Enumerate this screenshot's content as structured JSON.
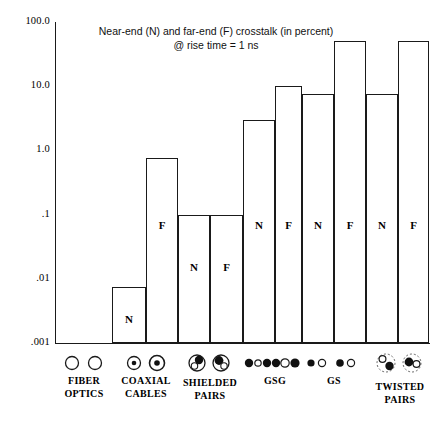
{
  "chart_data": {
    "type": "bar",
    "title": "Near-end (N) and far-end (F) crosstalk (in percent)\n@ rise time = 1 ns",
    "title_line1": "Near-end (N) and far-end (F) crosstalk (in percent)",
    "title_line2": "@ rise time = 1 ns",
    "xlabel": "",
    "ylabel": "",
    "yscale": "log",
    "ylim": [
      0.001,
      100.0
    ],
    "grid": false,
    "legend": "none",
    "ytick_labels": [
      "100.0",
      "10.0",
      "1.0",
      ".1",
      ".01",
      ".001"
    ],
    "ytick_values": [
      100.0,
      10.0,
      1.0,
      0.1,
      0.01,
      0.001
    ],
    "categories": [
      "FIBER OPTICS",
      "COAXIAL CABLES",
      "SHIELDED PAIRS",
      "GSG",
      "GS",
      "TWISTED PAIRS"
    ],
    "series": [
      {
        "name": "N",
        "label": "Near-end (N)",
        "values": [
          null,
          0.0075,
          0.1,
          3.0,
          7.5,
          7.5
        ]
      },
      {
        "name": "F",
        "label": "Far-end (F)",
        "values": [
          null,
          0.75,
          0.1,
          10.0,
          50.0,
          50.0
        ]
      }
    ],
    "bars": [
      {
        "category": "FIBER OPTICS",
        "series": "N",
        "value": null,
        "letter": "",
        "visible": false,
        "x": 55,
        "width": 28
      },
      {
        "category": "FIBER OPTICS",
        "series": "F",
        "value": null,
        "letter": "",
        "visible": false,
        "x": 84,
        "width": 28
      },
      {
        "category": "COAXIAL CABLES",
        "series": "N",
        "value": 0.0075,
        "letter": "N",
        "visible": true,
        "x": 112,
        "width": 34
      },
      {
        "category": "COAXIAL CABLES",
        "series": "F",
        "value": 0.75,
        "letter": "F",
        "visible": true,
        "x": 146,
        "width": 32
      },
      {
        "category": "SHIELDED PAIRS",
        "series": "N",
        "value": 0.1,
        "letter": "N",
        "visible": true,
        "x": 178,
        "width": 32
      },
      {
        "category": "SHIELDED PAIRS",
        "series": "F",
        "value": 0.1,
        "letter": "F",
        "visible": true,
        "x": 210,
        "width": 33
      },
      {
        "category": "GSG",
        "series": "N",
        "value": 3.0,
        "letter": "N",
        "visible": true,
        "x": 243,
        "width": 32
      },
      {
        "category": "GSG",
        "series": "F",
        "value": 10.0,
        "letter": "F",
        "visible": true,
        "x": 275,
        "width": 27
      },
      {
        "category": "GS",
        "series": "N",
        "value": 7.5,
        "letter": "N",
        "visible": true,
        "x": 302,
        "width": 32
      },
      {
        "category": "GS",
        "series": "F",
        "value": 50.0,
        "letter": "F",
        "visible": true,
        "x": 334,
        "width": 32
      },
      {
        "category": "TWISTED PAIRS",
        "series": "N",
        "value": 7.5,
        "letter": "N",
        "visible": true,
        "x": 366,
        "width": 32
      },
      {
        "category": "TWISTED PAIRS",
        "series": "F",
        "value": 50.0,
        "letter": "F",
        "visible": true,
        "x": 398,
        "width": 31
      }
    ]
  },
  "axis": {
    "y_labels": [
      {
        "text": "100.0",
        "value": 100.0
      },
      {
        "text": "10.0",
        "value": 10.0
      },
      {
        "text": "1.0",
        "value": 1.0
      },
      {
        "text": ".1",
        "value": 0.1
      },
      {
        "text": ".01",
        "value": 0.01
      },
      {
        "text": ".001",
        "value": 0.001
      }
    ]
  },
  "categories": [
    {
      "key": "fiber-optics",
      "label": "FIBER\nOPTICS",
      "icon": "two-hollow-circles-icon",
      "center": 84,
      "label_top": 378
    },
    {
      "key": "coaxial-cables",
      "label": "COAXIAL\nCABLES",
      "icon": "two-dot-in-circle-icon",
      "center": 146,
      "label_top": 378
    },
    {
      "key": "shielded-pairs",
      "label": "SHIELDED\nPAIRS",
      "icon": "two-overlapping-shield-circles-icon",
      "center": 210,
      "label_top": 382
    },
    {
      "key": "gsg",
      "label": "GSG",
      "icon": "gsg-conductor-dots-icon",
      "center": 275,
      "label_top": 378
    },
    {
      "key": "gs",
      "label": "GS",
      "icon": "gs-conductor-dots-icon",
      "center": 334,
      "label_top": 378
    },
    {
      "key": "twisted-pairs",
      "label": "TWISTED\nPAIRS",
      "icon": "two-dashed-twisted-pair-icon",
      "center": 400,
      "label_top": 386
    }
  ],
  "colors": {
    "line": "#1a1a1a",
    "background": "#ffffff",
    "text": "#000000"
  }
}
